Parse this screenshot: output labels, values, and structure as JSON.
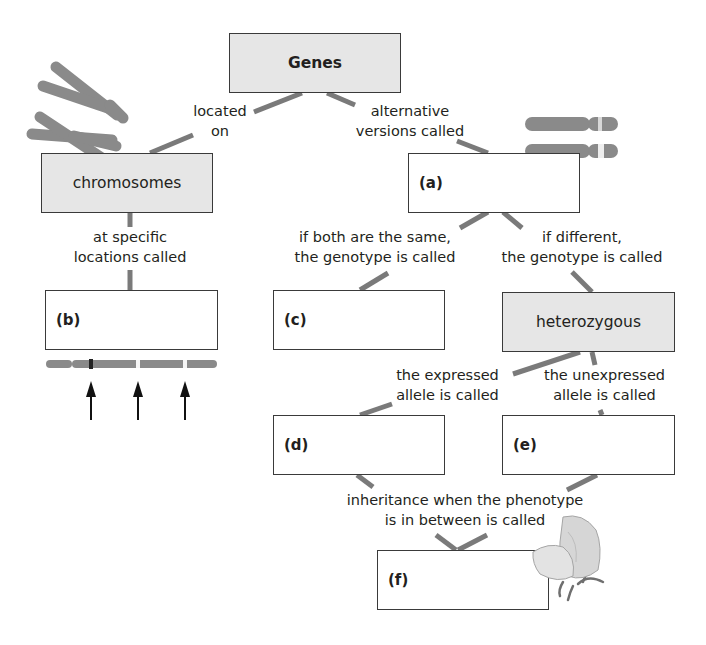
{
  "diagram": {
    "type": "concept-map",
    "colors": {
      "connector": "#7a7a7a",
      "box_border": "#3a3a3a",
      "filled_box": "#e6e6e6",
      "chromosome": "#8a8a8a"
    },
    "nodes": {
      "genes": {
        "text": "Genes"
      },
      "chromosomes": {
        "text": "chromosomes"
      },
      "a": {
        "label": "(a)"
      },
      "b": {
        "label": "(b)"
      },
      "c": {
        "label": "(c)"
      },
      "heterozygous": {
        "text": "heterozygous"
      },
      "d": {
        "label": "(d)"
      },
      "e": {
        "label": "(e)"
      },
      "f": {
        "label": "(f)"
      }
    },
    "links": {
      "located_on": [
        "located",
        "on"
      ],
      "alternative_versions": [
        "alternative",
        "versions called"
      ],
      "specific_locations": [
        "at specific",
        "locations called"
      ],
      "both_same": [
        "if both are the same,",
        "the genotype is called"
      ],
      "if_different": [
        "if different,",
        "the genotype is called"
      ],
      "expressed": [
        "the expressed",
        "allele is called"
      ],
      "unexpressed": [
        "the unexpressed",
        "allele is called"
      ],
      "in_between": [
        "inheritance when the phenotype",
        "is in between is called"
      ]
    },
    "illustrations": [
      "chromosome-pair-x-shaped",
      "homologous-chromosome-pair",
      "chromosome-with-gene-loci-arrows",
      "flower-illustration"
    ]
  }
}
